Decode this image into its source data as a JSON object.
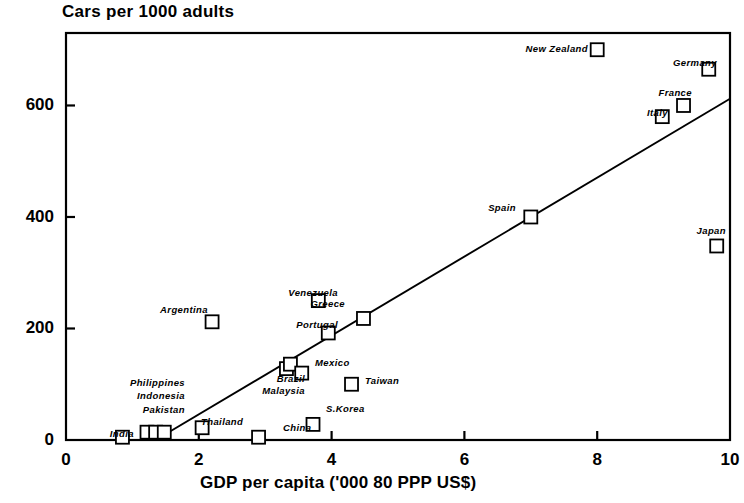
{
  "chart_data": {
    "type": "scatter",
    "title": "Cars per 1000 adults",
    "xlabel": "GDP per capita ('000 80 PPP US$)",
    "ylabel": "",
    "xlim": [
      0,
      10
    ],
    "ylim": [
      0,
      730
    ],
    "xticks": [
      "0",
      "2",
      "4",
      "6",
      "8",
      "10"
    ],
    "xtick_values": [
      0,
      2,
      4,
      6,
      8,
      10
    ],
    "yticks": [
      "0",
      "200",
      "400",
      "600"
    ],
    "ytick_values": [
      0,
      200,
      400,
      600
    ],
    "grid": false,
    "legend": "none",
    "marker": "open-square",
    "points": [
      {
        "name": "India",
        "x": 0.85,
        "y": 5,
        "label_side": "left"
      },
      {
        "name": "Pakistan",
        "x": 1.22,
        "y": 14,
        "label_side": "left"
      },
      {
        "name": "Indonesia",
        "x": 1.35,
        "y": 14,
        "label_side": "left"
      },
      {
        "name": "Philippines",
        "x": 1.48,
        "y": 14,
        "label_side": "left"
      },
      {
        "name": "Thailand",
        "x": 2.05,
        "y": 22,
        "label_side": "right"
      },
      {
        "name": "Argentina",
        "x": 2.2,
        "y": 212,
        "label_side": "left"
      },
      {
        "name": "China",
        "x": 2.9,
        "y": 5,
        "label_side": "right"
      },
      {
        "name": "Malaysia",
        "x": 3.32,
        "y": 128,
        "label_side": "left"
      },
      {
        "name": "Brazil",
        "x": 3.38,
        "y": 136,
        "label_side": "left"
      },
      {
        "name": "Mexico",
        "x": 3.55,
        "y": 120,
        "label_side": "right"
      },
      {
        "name": "S.Korea",
        "x": 3.72,
        "y": 28,
        "label_side": "right"
      },
      {
        "name": "Venezuela",
        "x": 3.8,
        "y": 250,
        "label_side": "left"
      },
      {
        "name": "Portugal",
        "x": 3.95,
        "y": 192,
        "label_side": "left"
      },
      {
        "name": "Taiwan",
        "x": 4.3,
        "y": 100,
        "label_side": "right"
      },
      {
        "name": "Greece",
        "x": 4.48,
        "y": 218,
        "label_side": "left"
      },
      {
        "name": "Spain",
        "x": 7.0,
        "y": 400,
        "label_side": "left"
      },
      {
        "name": "New Zealand",
        "x": 8.0,
        "y": 700,
        "label_side": "left"
      },
      {
        "name": "Italy",
        "x": 8.98,
        "y": 580,
        "label_side": "left"
      },
      {
        "name": "France",
        "x": 9.3,
        "y": 600,
        "label_side": "left"
      },
      {
        "name": "Germany",
        "x": 9.68,
        "y": 665,
        "label_side": "left"
      },
      {
        "name": "Japan",
        "x": 9.8,
        "y": 348,
        "label_side": "left"
      }
    ],
    "trend_line": {
      "name": "regression-line",
      "x0": 1.35,
      "y0": 0,
      "x1": 10.0,
      "y1": 612
    },
    "colors": {
      "axis": "#000000",
      "marker_stroke": "#000000",
      "marker_fill": "#ffffff",
      "line": "#000000",
      "background": "#ffffff"
    }
  }
}
